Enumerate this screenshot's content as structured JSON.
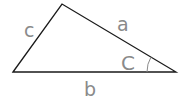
{
  "diagram": {
    "type": "triangle",
    "vertices": {
      "left": [
        13,
        72
      ],
      "top": [
        62,
        4
      ],
      "right": [
        176,
        72
      ]
    },
    "labels": {
      "side_c": "c",
      "side_a": "a",
      "side_b": "b",
      "angle_C": "C"
    },
    "colors": {
      "stroke": "#1a1a1a",
      "label": "#8a8a8a"
    }
  }
}
